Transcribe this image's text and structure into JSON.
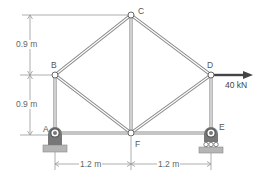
{
  "diagram": {
    "type": "plane-truss",
    "colors": {
      "member_outline": "#888888",
      "member_fill": "#ffffff",
      "support": "#777777",
      "ground": "#b0b0b0",
      "dimension": "#999999",
      "load_arrow": "#444444",
      "text": "#555555"
    },
    "joints": [
      {
        "id": "A",
        "label": "A"
      },
      {
        "id": "B",
        "label": "B"
      },
      {
        "id": "C",
        "label": "C"
      },
      {
        "id": "D",
        "label": "D"
      },
      {
        "id": "E",
        "label": "E"
      },
      {
        "id": "F",
        "label": "F"
      }
    ],
    "members": [
      "AB",
      "BC",
      "CD",
      "DE",
      "AF",
      "FE",
      "BF",
      "CF",
      "DF"
    ],
    "supports": [
      {
        "joint": "A",
        "type": "pin"
      },
      {
        "joint": "E",
        "type": "roller"
      }
    ],
    "load": {
      "joint": "D",
      "direction": "right",
      "label": "40 kN"
    },
    "dimensions": {
      "vertical": [
        {
          "label": "0.9 m",
          "span": "C-B"
        },
        {
          "label": "0.9 m",
          "span": "B-A"
        }
      ],
      "horizontal": [
        {
          "label": "1.2 m",
          "span": "A-F"
        },
        {
          "label": "1.2 m",
          "span": "F-E"
        }
      ]
    }
  }
}
